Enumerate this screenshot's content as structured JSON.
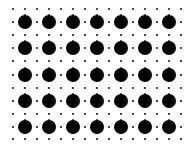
{
  "pattern": {
    "description": "Dot grid pattern",
    "big_dot_color": "#000000",
    "small_dot_color": "#222222",
    "background": "#ffffff",
    "columns": 7,
    "rows": 5,
    "col_x": [
      25,
      49,
      73,
      97,
      121,
      145,
      169
    ],
    "row_y": [
      22,
      48,
      75,
      101,
      127
    ],
    "big_dot_radius": 7,
    "small_dot_radius": 1.1,
    "small_row_y": [
      9,
      35,
      61,
      88,
      114,
      139
    ],
    "small_col_x": [
      13,
      25,
      37,
      49,
      61,
      73,
      85,
      97,
      109,
      121,
      133,
      145,
      157,
      169,
      181
    ]
  }
}
